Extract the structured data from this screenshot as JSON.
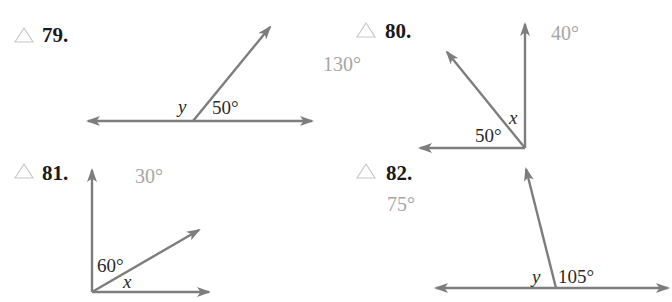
{
  "colors": {
    "ray": "#7d7d7d",
    "answer": "#a6a6a6",
    "label": "#2a2a2a",
    "problem_number": "#1a1a1a",
    "triangle_icon": "#c8c8c8"
  },
  "problems": [
    {
      "number": "79.",
      "icon": "triangle-icon",
      "answer": "130°",
      "angle_label": "50°",
      "variable": "y"
    },
    {
      "number": "80.",
      "icon": "triangle-icon",
      "answer": "40°",
      "angle_label": "50°",
      "variable": "x"
    },
    {
      "number": "81.",
      "icon": "triangle-icon",
      "answer": "30°",
      "angle_label": "60°",
      "variable": "x"
    },
    {
      "number": "82.",
      "icon": "triangle-icon",
      "answer": "75°",
      "angle_label": "105°",
      "variable": "y"
    }
  ]
}
